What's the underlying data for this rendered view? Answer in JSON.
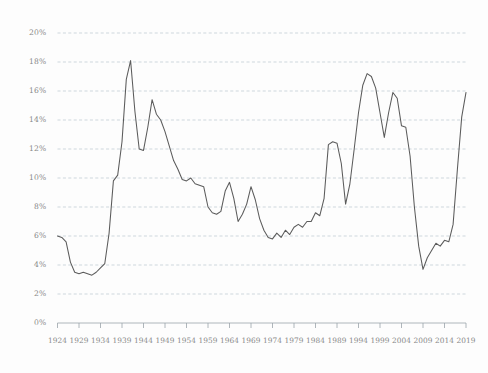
{
  "chart_data": {
    "type": "line",
    "title": "",
    "subtitle": "",
    "xlabel": "",
    "ylabel": "",
    "xlim": [
      1924,
      2019
    ],
    "ylim": [
      0,
      20
    ],
    "grid": true,
    "legend": false,
    "legend_position": "none",
    "y_tick_labels": [
      "0%",
      "2%",
      "4%",
      "6%",
      "8%",
      "10%",
      "12%",
      "14%",
      "16%",
      "18%",
      "20%"
    ],
    "y_tick_values": [
      0,
      2,
      4,
      6,
      8,
      10,
      12,
      14,
      16,
      18,
      20
    ],
    "x_tick_labels": [
      "1924",
      "1929",
      "1934",
      "1939",
      "1944",
      "1949",
      "1954",
      "1959",
      "1964",
      "1969",
      "1974",
      "1979",
      "1984",
      "1989",
      "1994",
      "1999",
      "2004",
      "2009",
      "2014",
      "2019"
    ],
    "x_tick_values": [
      1924,
      1929,
      1934,
      1939,
      1944,
      1949,
      1954,
      1959,
      1964,
      1969,
      1974,
      1979,
      1984,
      1989,
      1994,
      1999,
      2004,
      2009,
      2014,
      2019
    ],
    "series": [
      {
        "name": "Unemployment rate",
        "color": "#5b5b5b",
        "x": [
          1924,
          1925,
          1926,
          1927,
          1928,
          1929,
          1930,
          1931,
          1932,
          1933,
          1934,
          1935,
          1936,
          1937,
          1938,
          1939,
          1940,
          1941,
          1942,
          1943,
          1944,
          1945,
          1946,
          1947,
          1948,
          1949,
          1950,
          1951,
          1952,
          1953,
          1954,
          1955,
          1956,
          1957,
          1958,
          1959,
          1960,
          1961,
          1962,
          1963,
          1964,
          1965,
          1966,
          1967,
          1968,
          1969,
          1970,
          1971,
          1972,
          1973,
          1974,
          1975,
          1976,
          1977,
          1978,
          1979,
          1980,
          1981,
          1982,
          1983,
          1984,
          1985,
          1986,
          1987,
          1988,
          1989,
          1990,
          1991,
          1992,
          1993,
          1994,
          1995,
          1996,
          1997,
          1998,
          1999,
          2000,
          2001,
          2002,
          2003,
          2004,
          2005,
          2006,
          2007,
          2008,
          2009,
          2010,
          2011,
          2012,
          2013,
          2014,
          2015,
          2016,
          2017,
          2018,
          2019
        ],
        "values": [
          6.0,
          5.8,
          4.6,
          3.6,
          3.4,
          3.5,
          3.3,
          3.6,
          3.9,
          10.0,
          18.1,
          12.0,
          12.1,
          15.4,
          14.7,
          14.2,
          12.6,
          10.7,
          9.9,
          9.9,
          8.0,
          6.0,
          5.9,
          5.7,
          5.5,
          5.0,
          4.5,
          4.0,
          3.6,
          3.5,
          5.5,
          4.4,
          4.1,
          4.3,
          6.8,
          5.5,
          5.5,
          6.7,
          5.6,
          5.7,
          5.2,
          4.5,
          3.8,
          3.8,
          3.6,
          3.5,
          4.9,
          5.9,
          5.6,
          4.9,
          5.6,
          8.5,
          7.7,
          7.1,
          6.1,
          5.9,
          7.2,
          7.6,
          9.7,
          9.6,
          7.5,
          7.2,
          7.0,
          6.2,
          5.5,
          5.3,
          5.6,
          6.9,
          7.5,
          6.9,
          6.1,
          5.6,
          5.4,
          4.9,
          4.5,
          4.2,
          4.0,
          4.7,
          5.8,
          6.0,
          5.5,
          5.1,
          4.6,
          4.6,
          5.8,
          9.3,
          9.6,
          8.9,
          8.1,
          7.4,
          6.2,
          5.3,
          4.9,
          4.4,
          3.9,
          3.7
        ]
      }
    ],
    "rendered_series": {
      "name": "Unemployment rate",
      "x": [
        1924,
        1925,
        1926,
        1927,
        1928,
        1929,
        1930,
        1931,
        1932,
        1933,
        1934,
        1935,
        1936,
        1937,
        1938,
        1939,
        1940,
        1941,
        1942,
        1943,
        1944,
        1945,
        1946,
        1947,
        1948,
        1949,
        1950,
        1951,
        1952,
        1953,
        1954,
        1955,
        1956,
        1957,
        1958,
        1959,
        1960,
        1961,
        1962,
        1963,
        1964,
        1965,
        1966,
        1967,
        1968,
        1969,
        1970,
        1971,
        1972,
        1973,
        1974,
        1975,
        1976,
        1977,
        1978,
        1979,
        1980,
        1981,
        1982,
        1983,
        1984,
        1985,
        1986,
        1987,
        1988,
        1989,
        1990,
        1991,
        1992,
        1993,
        1994,
        1995,
        1996,
        1997,
        1998,
        1999,
        2000,
        2001,
        2002,
        2003,
        2004,
        2005,
        2006,
        2007,
        2008,
        2009,
        2010,
        2011,
        2012,
        2013,
        2014,
        2015,
        2016,
        2017,
        2018,
        2019
      ],
      "values": [
        6.0,
        5.9,
        5.6,
        4.2,
        3.5,
        3.4,
        3.5,
        3.4,
        3.3,
        3.5,
        3.8,
        4.1,
        6.2,
        9.8,
        10.2,
        12.5,
        16.8,
        18.1,
        14.6,
        12.0,
        11.9,
        13.5,
        15.4,
        14.4,
        14.0,
        13.2,
        12.2,
        11.2,
        10.6,
        9.9,
        9.8,
        10.0,
        9.6,
        9.5,
        9.4,
        8.0,
        7.6,
        7.5,
        7.7,
        9.1,
        9.7,
        8.6,
        7.0,
        7.5,
        8.2,
        9.4,
        8.5,
        7.2,
        6.4,
        5.9,
        5.8,
        6.2,
        5.9,
        6.4,
        6.1,
        6.6,
        6.8,
        6.6,
        7.0,
        7.0,
        7.6,
        7.4,
        8.6,
        12.3,
        12.5,
        12.4,
        11.0,
        8.2,
        9.6,
        12.0,
        14.5,
        16.4,
        17.2,
        17.0,
        16.2,
        14.5,
        12.8,
        14.5,
        15.9,
        15.5,
        13.6,
        13.5,
        11.5,
        8.0,
        5.3,
        3.7,
        4.5,
        5.0,
        5.5,
        5.3,
        5.7,
        5.6,
        6.8,
        10.6,
        14.2,
        15.9,
        13.8,
        11.0,
        8.5,
        6.6,
        5.6,
        5.4
      ],
      "note": "y-values read off the plotted curve at 1-year resolution"
    }
  },
  "axis": {
    "y_unit": "%",
    "x_unit": "year"
  }
}
